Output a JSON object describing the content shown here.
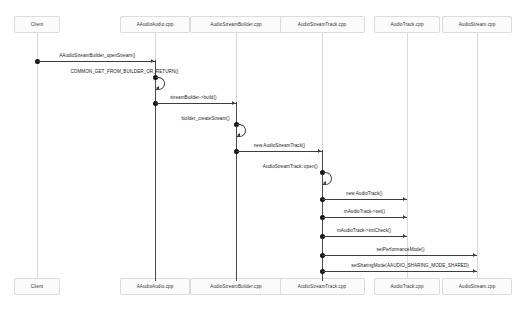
{
  "diagram": {
    "type": "uml-sequence-diagram",
    "background": "#ffffff",
    "line_color": "#3c3c3c",
    "lifeline_color": "#d9d9d9",
    "box_fill": "#fbfbfb",
    "box_border": "#dcdcdc"
  },
  "participants": [
    {
      "id": "client",
      "label": "Client",
      "x": 37
    },
    {
      "id": "aaudio",
      "label": "AAudioAudio.cpp",
      "x": 155
    },
    {
      "id": "builder",
      "label": "AudioStreamBuilder.cpp",
      "x": 236
    },
    {
      "id": "track",
      "label": "AudioStreamTrack.cpp",
      "x": 322
    },
    {
      "id": "atrack",
      "label": "AudioTrack.cpp",
      "x": 407
    },
    {
      "id": "stream",
      "label": "AudioStream.cpp",
      "x": 477
    }
  ],
  "messages": [
    {
      "label": "AAudioStreamBuilder_openStream()",
      "from": "client",
      "to": "aaudio",
      "y": 61,
      "self": false
    },
    {
      "label": "COMMON_GET_FROM_BUILDER_OR_RETURN()",
      "from": "aaudio",
      "to": "aaudio",
      "y": 77,
      "self": true
    },
    {
      "label": "streamBuilder->build()",
      "from": "aaudio",
      "to": "builder",
      "y": 103,
      "self": false
    },
    {
      "label": "builder_createStream()",
      "from": "builder",
      "to": "builder",
      "y": 124,
      "self": true
    },
    {
      "label": "new AudioStreamTrack()",
      "from": "builder",
      "to": "track",
      "y": 151,
      "self": false
    },
    {
      "label": "AudioStreamTrack::open()",
      "from": "track",
      "to": "track",
      "y": 172,
      "self": true
    },
    {
      "label": "new AudioTrack()",
      "from": "track",
      "to": "atrack",
      "y": 199,
      "self": false
    },
    {
      "label": "mAudioTrack->set()",
      "from": "track",
      "to": "atrack",
      "y": 217,
      "self": false
    },
    {
      "label": "mAudioTrack->initCheck()",
      "from": "track",
      "to": "atrack",
      "y": 236,
      "self": false
    },
    {
      "label": "setPerformanceMode()",
      "from": "track",
      "to": "stream",
      "y": 255,
      "self": false
    },
    {
      "label": "setSharingMode(AAUDIO_SHARING_MODE_SHARED)",
      "from": "track",
      "to": "stream",
      "y": 271,
      "self": false
    }
  ],
  "activations": [
    {
      "participant": "aaudio",
      "top": 60,
      "bottom": 281
    },
    {
      "participant": "builder",
      "top": 102,
      "bottom": 281
    },
    {
      "participant": "track",
      "top": 150,
      "bottom": 281
    }
  ],
  "header_boxes_y": 16,
  "footer_boxes_y": 278,
  "box_height": 17
}
